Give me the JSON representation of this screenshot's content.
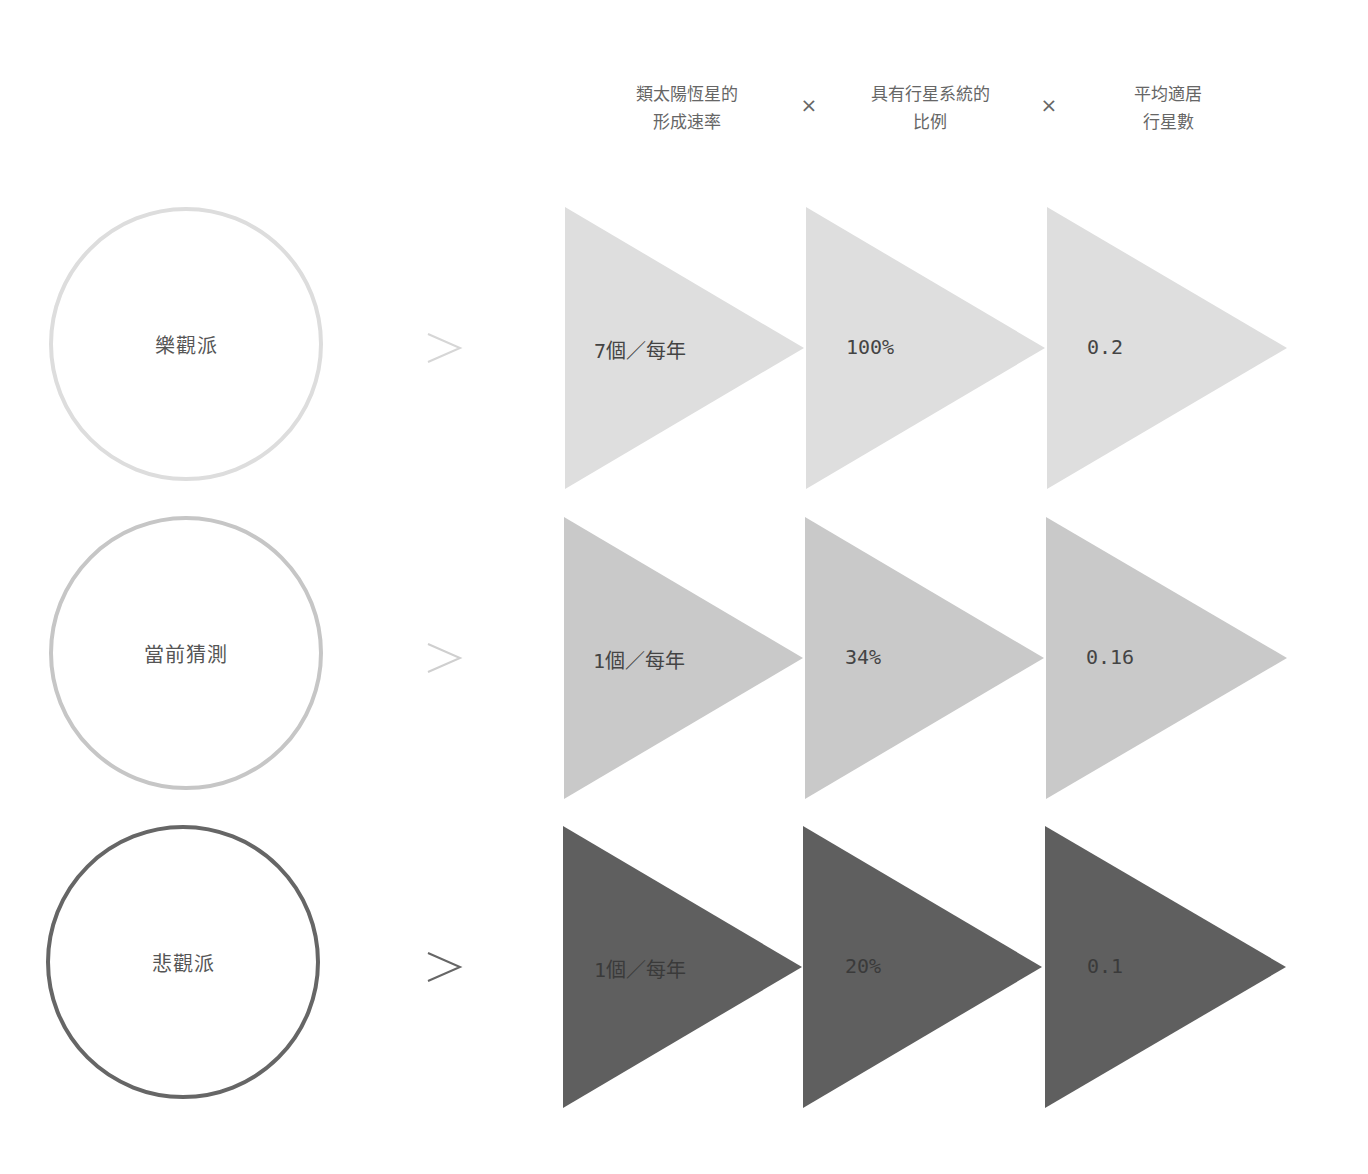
{
  "headers": [
    {
      "line1": "類太陽恆星的",
      "line2": "形成速率"
    },
    {
      "line1": "具有行星系統的",
      "line2": "比例"
    },
    {
      "line1": "平均適居",
      "line2": "行星數"
    }
  ],
  "operators": [
    "×",
    "×"
  ],
  "rows": [
    {
      "scenario": "樂觀派",
      "circle_color": "#dddddd",
      "arrow_color": "#d6d6d6",
      "triangle_color": "#dedede",
      "values": [
        "7個／每年",
        "100%",
        "0.2"
      ]
    },
    {
      "scenario": "當前猜測",
      "circle_color": "#c6c6c6",
      "arrow_color": "#cfcfcf",
      "triangle_color": "#c9c9c9",
      "values": [
        "1個／每年",
        "34%",
        "0.16"
      ]
    },
    {
      "scenario": "悲觀派",
      "circle_color": "#666666",
      "arrow_color": "#666666",
      "triangle_color": "#5f5f5f",
      "values": [
        "1個／每年",
        "20%",
        "0.1"
      ]
    }
  ]
}
